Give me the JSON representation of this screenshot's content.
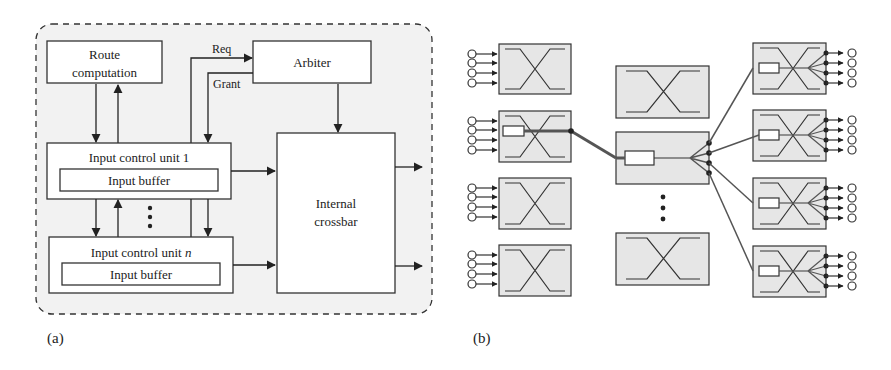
{
  "panel_a": {
    "caption": "(a)",
    "route_box": {
      "line1": "Route",
      "line2": "computation"
    },
    "arbiter_label": "Arbiter",
    "req_label": "Req",
    "grant_label": "Grant",
    "icu1": {
      "title": "Input control unit 1",
      "buffer": "Input buffer"
    },
    "icun": {
      "title_prefix": "Input control unit ",
      "title_var": "n",
      "buffer": "Input buffer"
    },
    "crossbar": {
      "line1": "Internal",
      "line2": "crossbar"
    }
  },
  "panel_b": {
    "caption": "(b)",
    "left_switches": 4,
    "middle_switches": 3,
    "right_switches": 4,
    "inputs_per_switch": 4
  },
  "colors": {
    "panel_fill": "#f2f2f2",
    "switch_fill": "#e6e6e6",
    "stroke": "#333333",
    "path_stroke": "#555555"
  }
}
